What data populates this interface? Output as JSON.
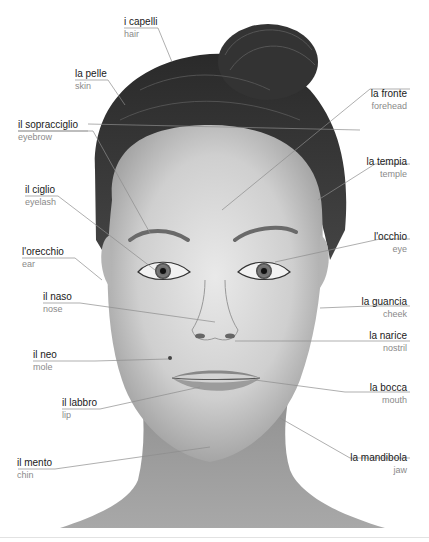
{
  "diagram": {
    "colors": {
      "line": "#8c8c8c",
      "italian_text": "#1a1a1a",
      "english_text": "#8a8a8a",
      "background": "#ffffff"
    },
    "labels": [
      {
        "id": "hair",
        "italian": "i capelli",
        "english": "hair",
        "side": "left"
      },
      {
        "id": "skin",
        "italian": "la pelle",
        "english": "skin",
        "side": "left"
      },
      {
        "id": "eyebrow",
        "italian": "il sopracciglio",
        "english": "eyebrow",
        "side": "left"
      },
      {
        "id": "eyelash",
        "italian": "il ciglio",
        "english": "eyelash",
        "side": "left"
      },
      {
        "id": "ear",
        "italian": "l'orecchio",
        "english": "ear",
        "side": "left"
      },
      {
        "id": "nose",
        "italian": "il naso",
        "english": "nose",
        "side": "left"
      },
      {
        "id": "mole",
        "italian": "il neo",
        "english": "mole",
        "side": "left"
      },
      {
        "id": "lip",
        "italian": "il labbro",
        "english": "lip",
        "side": "left"
      },
      {
        "id": "chin",
        "italian": "il mento",
        "english": "chin",
        "side": "left"
      },
      {
        "id": "forehead",
        "italian": "la fronte",
        "english": "forehead",
        "side": "right"
      },
      {
        "id": "temple",
        "italian": "la tempia",
        "english": "temple",
        "side": "right"
      },
      {
        "id": "eye",
        "italian": "l'occhio",
        "english": "eye",
        "side": "right"
      },
      {
        "id": "cheek",
        "italian": "la guancia",
        "english": "cheek",
        "side": "right"
      },
      {
        "id": "nostril",
        "italian": "la narice",
        "english": "nostril",
        "side": "right"
      },
      {
        "id": "mouth",
        "italian": "la bocca",
        "english": "mouth",
        "side": "right"
      },
      {
        "id": "jaw",
        "italian": "la mandibola",
        "english": "jaw",
        "side": "right"
      }
    ]
  }
}
